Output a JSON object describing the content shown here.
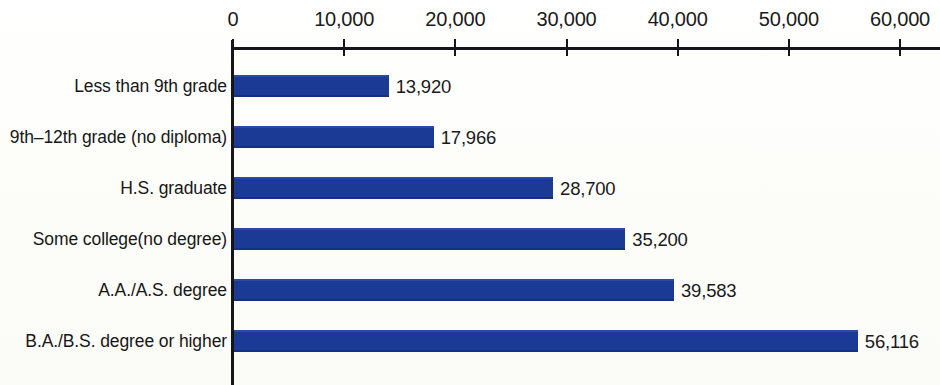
{
  "chart_data": {
    "type": "bar",
    "orientation": "horizontal",
    "title": "",
    "xlabel": "",
    "ylabel": "",
    "xlim": [
      0,
      63000
    ],
    "grid": false,
    "legend": false,
    "bar_color": "#1a3a96",
    "axis_color": "#16161a",
    "background_color": "#fdfdfb",
    "xticks": [
      0,
      10000,
      20000,
      30000,
      40000,
      50000,
      60000
    ],
    "xtick_labels": [
      "0",
      "10,000",
      "20,000",
      "30,000",
      "40,000",
      "50,000",
      "60,000"
    ],
    "categories": [
      "Less than 9th grade",
      "9th–12th grade (no diploma)",
      "H.S. graduate",
      "Some college(no degree)",
      "A.A./A.S. degree",
      "B.A./B.S. degree or higher"
    ],
    "values": [
      13920,
      17966,
      28700,
      35200,
      39583,
      56116
    ],
    "value_labels": [
      "13,920",
      "17,966",
      "28,700",
      "35,200",
      "39,583",
      "56,116"
    ],
    "bars": [
      {
        "category": "Less than 9th grade",
        "value": 13920,
        "label": "13,920"
      },
      {
        "category": "9th–12th grade (no diploma)",
        "value": 17966,
        "label": "17,966"
      },
      {
        "category": "H.S. graduate",
        "value": 28700,
        "label": "28,700"
      },
      {
        "category": "Some college(no degree)",
        "value": 35200,
        "label": "35,200"
      },
      {
        "category": "A.A./A.S. degree",
        "value": 39583,
        "label": "39,583"
      },
      {
        "category": "B.A./B.S. degree or higher",
        "value": 56116,
        "label": "56,116"
      }
    ]
  }
}
